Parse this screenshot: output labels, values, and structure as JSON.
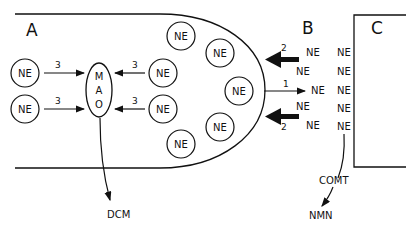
{
  "diagram": {
    "regions": {
      "a_label": "A",
      "b_label": "B",
      "c_label": "C"
    },
    "enzyme": {
      "mao_letters": [
        "M",
        "A",
        "O"
      ],
      "comt_label": "COMT"
    },
    "metabolites": {
      "dcm_label": "DCM",
      "nmn_label": "NMN"
    },
    "molecule_label": "NE",
    "arrow_labels": {
      "mao_left_top": "3",
      "mao_left_bottom": "3",
      "mao_right_top": "3",
      "mao_right_bottom": "3",
      "reuptake_top": "2",
      "release": "1",
      "reuptake_bottom": "2"
    },
    "vesicles_in_terminal": [
      "NE",
      "NE",
      "NE",
      "NE",
      "NE"
    ],
    "cytoplasm_ne": [
      "NE",
      "NE",
      "NE",
      "NE"
    ],
    "synaptic_cleft_ne": {
      "left_column": [
        "NE",
        "NE",
        "NE",
        "NE",
        "NE"
      ],
      "right_column": [
        "NE",
        "NE",
        "NE",
        "NE",
        "NE",
        "NE"
      ]
    },
    "colors": {
      "ink": "#111111",
      "background": "#ffffff"
    }
  }
}
